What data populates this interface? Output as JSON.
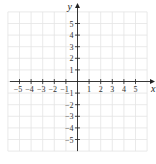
{
  "chart_data": {
    "type": "scatter",
    "title": "",
    "xlabel": "x",
    "ylabel": "y",
    "xlim": [
      -5,
      5
    ],
    "ylim": [
      -5,
      5
    ],
    "x_ticks": [
      -5,
      -4,
      -3,
      -2,
      -1,
      1,
      2,
      3,
      4,
      5
    ],
    "y_ticks": [
      -5,
      -4,
      -3,
      -2,
      -1,
      1,
      2,
      3,
      4,
      5
    ],
    "x_tick_labels": [
      "−5",
      "−4",
      "−3",
      "−2",
      "−1",
      "1",
      "2",
      "3",
      "4",
      "5"
    ],
    "y_tick_labels": [
      "−5",
      "−4",
      "−3",
      "−2",
      "−1",
      "1",
      "2",
      "3",
      "4",
      "5"
    ],
    "grid": true,
    "grid_extent": {
      "x": [
        -6,
        6
      ],
      "y": [
        -6,
        6
      ]
    },
    "series": [],
    "legend": null
  },
  "layout": {
    "origin_px": [
      77.5,
      81.5
    ],
    "unit_px": 11.6,
    "grid_color": "#e4e4e4",
    "axis_color": "#222222"
  }
}
